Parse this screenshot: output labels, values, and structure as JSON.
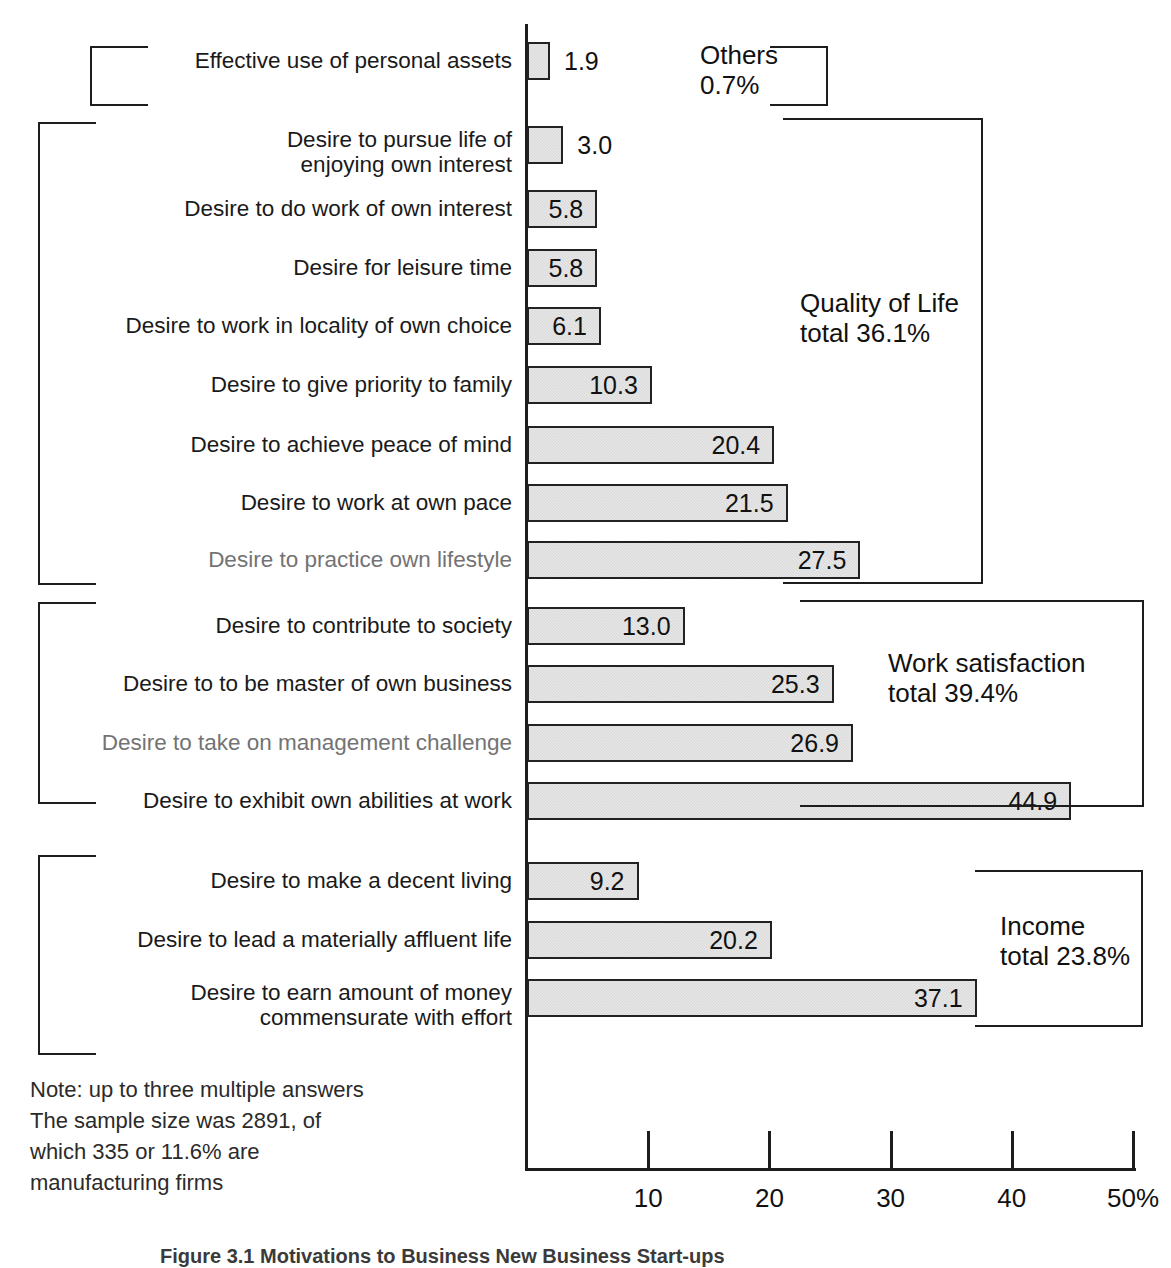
{
  "chart_data": {
    "type": "bar",
    "orientation": "horizontal",
    "title": "",
    "xlabel": "",
    "ylabel": "",
    "xlim": [
      0,
      50
    ],
    "grid": false,
    "axis": {
      "ticks": [
        10,
        20,
        30,
        40,
        50
      ],
      "tick_labels": [
        "10",
        "20",
        "30",
        "40",
        "50%"
      ],
      "unit": "%"
    },
    "categories": [
      "Effective use of personal assets",
      "Desire to pursue life of\nenjoying own interest",
      "Desire to do work of own interest",
      "Desire for leisure time",
      "Desire to work in locality of own choice",
      "Desire to give priority to family",
      "Desire to achieve peace of mind",
      "Desire to work at own pace",
      "Desire to practice own lifestyle",
      "Desire to contribute to society",
      "Desire to to be master of own business",
      "Desire to take on management challenge",
      "Desire to exhibit own abilities at work",
      "Desire to make a decent living",
      "Desire to lead a materially affluent life",
      "Desire to earn amount of money\ncommensurate with effort"
    ],
    "values": [
      1.9,
      3.0,
      5.8,
      5.8,
      6.1,
      10.3,
      20.4,
      21.5,
      27.5,
      13.0,
      25.3,
      26.9,
      44.9,
      9.2,
      20.2,
      37.1
    ],
    "value_labels": [
      "1.9",
      "3.0",
      "5.8",
      "5.8",
      "6.1",
      "10.3",
      "20.4",
      "21.5",
      "27.5",
      "13.0",
      "25.3",
      "26.9",
      "44.9",
      "9.2",
      "20.2",
      "37.1"
    ],
    "groups": [
      {
        "name": "Others",
        "total_label": "Others\n0.7%",
        "total": 0.7,
        "items": [
          0
        ]
      },
      {
        "name": "Quality of Life",
        "total_label": "Quality of Life\ntotal 36.1%",
        "total": 36.1,
        "items": [
          1,
          2,
          3,
          4,
          5,
          6,
          7,
          8
        ]
      },
      {
        "name": "Work satisfaction",
        "total_label": "Work satisfaction\ntotal 39.4%",
        "total": 39.4,
        "items": [
          9,
          10,
          11,
          12
        ]
      },
      {
        "name": "Income",
        "total_label": "Income\ntotal 23.8%",
        "total": 23.8,
        "items": [
          13,
          14,
          15
        ]
      }
    ],
    "note": "Note: up to three multiple answers\nThe sample size was 2891, of\nwhich 335 or 11.6% are\nmanufacturing firms",
    "caption": "Figure 3.1  Motivations to Business New Business Start-ups",
    "colors": {
      "bar_fill": "#e9e9e9",
      "bar_stroke": "#222222",
      "text": "#1a1a1a",
      "axis": "#1d1d1d"
    }
  },
  "rows": [
    {
      "label": "Effective use of personal assets",
      "value": 1.9,
      "value_label": "1.9",
      "faint": false
    },
    {
      "label": "Desire to pursue life of\nenjoying own interest",
      "value": 3.0,
      "value_label": "3.0",
      "faint": false
    },
    {
      "label": "Desire to do work of own interest",
      "value": 5.8,
      "value_label": "5.8",
      "faint": false
    },
    {
      "label": "Desire for leisure time",
      "value": 5.8,
      "value_label": "5.8",
      "faint": false
    },
    {
      "label": "Desire to work in locality of own choice",
      "value": 6.1,
      "value_label": "6.1",
      "faint": false
    },
    {
      "label": "Desire to give priority to family",
      "value": 10.3,
      "value_label": "10.3",
      "faint": false
    },
    {
      "label": "Desire to achieve peace of mind",
      "value": 20.4,
      "value_label": "20.4",
      "faint": false
    },
    {
      "label": "Desire to work at own pace",
      "value": 21.5,
      "value_label": "21.5",
      "faint": false
    },
    {
      "label": "Desire to practice own lifestyle",
      "value": 27.5,
      "value_label": "27.5",
      "faint": true
    },
    {
      "label": "Desire to contribute to society",
      "value": 13.0,
      "value_label": "13.0",
      "faint": false
    },
    {
      "label": "Desire to to be master of own business",
      "value": 25.3,
      "value_label": "25.3",
      "faint": false
    },
    {
      "label": "Desire to take on management challenge",
      "value": 26.9,
      "value_label": "26.9",
      "faint": true
    },
    {
      "label": "Desire to exhibit own abilities at work",
      "value": 44.9,
      "value_label": "44.9",
      "faint": false
    },
    {
      "label": "Desire to make a decent living",
      "value": 9.2,
      "value_label": "9.2",
      "faint": false
    },
    {
      "label": "Desire to lead a materially affluent life",
      "value": 20.2,
      "value_label": "20.2",
      "faint": false
    },
    {
      "label": "Desire to earn amount of money\ncommensurate with effort",
      "value": 37.1,
      "value_label": "37.1",
      "faint": false
    }
  ],
  "group_captions": [
    {
      "text": "Others\n0.7%"
    },
    {
      "text": "Quality of Life\ntotal 36.1%"
    },
    {
      "text": "Work satisfaction\ntotal 39.4%"
    },
    {
      "text": "Income\ntotal 23.8%"
    }
  ],
  "axis_ticks": [
    {
      "label": "10",
      "value": 10
    },
    {
      "label": "20",
      "value": 20
    },
    {
      "label": "30",
      "value": 30
    },
    {
      "label": "40",
      "value": 40
    },
    {
      "label": "50%",
      "value": 50
    }
  ],
  "note": "Note: up to three multiple answers\nThe sample size was 2891, of\nwhich 335 or 11.6% are\nmanufacturing firms",
  "caption": "Figure 3.1  Motivations to Business New Business Start-ups"
}
